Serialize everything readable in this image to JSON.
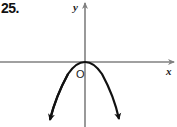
{
  "problem_number": "25.",
  "axes": {
    "x_label": "x",
    "y_label": "y",
    "origin_label": "O",
    "axis_color": "#808080"
  },
  "curve": {
    "type": "parabola",
    "opens": "down",
    "vertex": "origin",
    "color": "#111111"
  }
}
